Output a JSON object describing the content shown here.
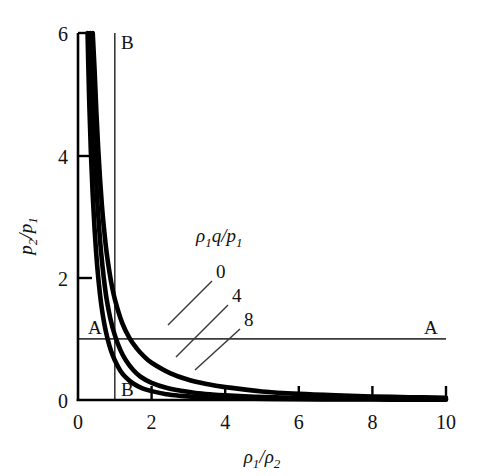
{
  "chart_data": {
    "type": "line",
    "title": "",
    "xlabel": "ρ₁/ρ₂",
    "ylabel": "p₂/p₁",
    "xlim": [
      0,
      10
    ],
    "ylim": [
      0,
      6
    ],
    "xticks": [
      "0",
      "2",
      "4",
      "6",
      "8",
      "10"
    ],
    "xtick_values": [
      0,
      2,
      4,
      6,
      8,
      10
    ],
    "yticks": [
      "0",
      "2",
      "4",
      "6"
    ],
    "ytick_values": [
      0,
      2,
      4,
      6
    ],
    "grid": false,
    "legend_position": "inside-center",
    "legend_title": "ρ₁q/p₁",
    "series": [
      {
        "name": "0",
        "label": "0",
        "parameter": 0,
        "color": "#000000",
        "x": [
          0.4,
          0.45,
          0.5,
          0.55,
          0.6,
          0.65,
          0.7,
          0.75,
          0.8,
          0.9,
          1.0,
          1.2,
          1.4,
          1.6,
          1.8,
          2.0,
          2.5,
          3.0,
          3.5,
          4.0,
          5.0,
          6.0,
          7.0,
          8.0,
          9.0,
          10.0
        ],
        "y": [
          6.0,
          5.4,
          4.7,
          4.1,
          3.6,
          3.18,
          2.84,
          2.55,
          2.31,
          1.93,
          1.65,
          1.26,
          1.01,
          0.84,
          0.71,
          0.61,
          0.44,
          0.33,
          0.26,
          0.21,
          0.14,
          0.1,
          0.075,
          0.058,
          0.046,
          0.038
        ]
      },
      {
        "name": "4",
        "label": "4",
        "parameter": 4,
        "color": "#000000",
        "x": [
          0.33,
          0.38,
          0.43,
          0.48,
          0.53,
          0.58,
          0.63,
          0.7,
          0.78,
          0.88,
          1.0,
          1.15,
          1.3,
          1.5,
          1.7,
          2.0,
          2.4,
          2.8,
          3.2,
          3.6,
          4.0,
          4.8,
          5.6,
          6.4,
          7.2,
          8.0,
          9.0,
          10.0
        ],
        "y": [
          6.0,
          5.1,
          4.35,
          3.72,
          3.2,
          2.77,
          2.4,
          2.0,
          1.64,
          1.33,
          1.06,
          0.82,
          0.65,
          0.49,
          0.38,
          0.28,
          0.2,
          0.15,
          0.115,
          0.092,
          0.075,
          0.053,
          0.04,
          0.031,
          0.025,
          0.021,
          0.017,
          0.014
        ]
      },
      {
        "name": "8",
        "label": "8",
        "parameter": 8,
        "color": "#000000",
        "x": [
          0.26,
          0.3,
          0.35,
          0.4,
          0.45,
          0.5,
          0.56,
          0.63,
          0.71,
          0.8,
          0.9,
          1.0,
          1.15,
          1.3,
          1.5,
          1.75,
          2.0,
          2.4,
          2.8,
          3.2,
          3.6,
          4.0,
          4.6,
          5.2,
          6.0,
          7.0,
          8.0,
          9.0,
          10.0
        ],
        "y": [
          6.0,
          5.0,
          4.05,
          3.35,
          2.8,
          2.36,
          1.94,
          1.57,
          1.26,
          1.01,
          0.8,
          0.65,
          0.48,
          0.37,
          0.27,
          0.19,
          0.145,
          0.095,
          0.068,
          0.05,
          0.039,
          0.031,
          0.023,
          0.018,
          0.013,
          0.009,
          0.007,
          0.005,
          0.004
        ]
      }
    ],
    "reference_lines": [
      {
        "name": "A",
        "label_left": "A",
        "label_right": "A",
        "orientation": "horizontal",
        "value": 1.0,
        "description": "p₂/p₁ = 1"
      },
      {
        "name": "B",
        "label_top": "B",
        "label_bottom": "B",
        "orientation": "vertical",
        "value": 1.0,
        "description": "ρ₁/ρ₂ = 1"
      }
    ],
    "annotations": [
      {
        "text": "ρ₁q/p₁",
        "role": "legend-title"
      },
      {
        "text": "0",
        "role": "curve-label"
      },
      {
        "text": "4",
        "role": "curve-label"
      },
      {
        "text": "8",
        "role": "curve-label"
      },
      {
        "text": "A",
        "role": "reference-line-label"
      },
      {
        "text": "A",
        "role": "reference-line-label"
      },
      {
        "text": "B",
        "role": "reference-line-label"
      },
      {
        "text": "B",
        "role": "reference-line-label"
      }
    ]
  },
  "axis": {
    "x_label_parts": {
      "rho": "ρ",
      "one": "1",
      "slash": "/",
      "rho2": "ρ",
      "two": "2"
    },
    "y_label_parts": {
      "p": "p",
      "two": "2",
      "slash": "/",
      "p1": "p",
      "one": "1"
    },
    "legend_parts": {
      "rho": "ρ",
      "one": "1",
      "q": "q",
      "slash": "/",
      "p": "p",
      "p_one": "1"
    }
  },
  "labels": {
    "x_ticks": [
      "0",
      "2",
      "4",
      "6",
      "8",
      "10"
    ],
    "y_ticks": [
      "0",
      "2",
      "4",
      "6"
    ],
    "curve_0": "0",
    "curve_4": "4",
    "curve_8": "8",
    "line_a_left": "A",
    "line_a_right": "A",
    "line_b_top": "B",
    "line_b_bottom": "B"
  },
  "colors": {
    "curve": "#000000",
    "axis": "#000000",
    "reference_line": "#3a3a3a",
    "background": "#ffffff",
    "text": "#111111"
  }
}
